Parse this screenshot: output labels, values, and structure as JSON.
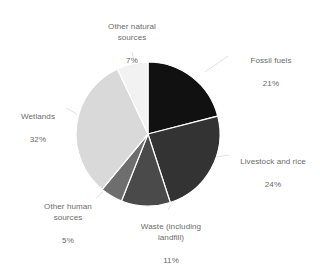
{
  "chart_data": {
    "type": "pie",
    "title": "",
    "subtitle": "",
    "xlabel": "",
    "ylabel": "",
    "legend_position": "labels-outside",
    "grid": false,
    "unit": "%",
    "categories": [
      "Fossil fuels",
      "Livestock and rice",
      "Waste (including landfill)",
      "Other human sources",
      "Wetlands",
      "Other natural sources"
    ],
    "values": [
      21,
      24,
      11,
      5,
      32,
      7
    ],
    "colors": [
      "#111111",
      "#333333",
      "#4a4a4a",
      "#6e6e6e",
      "#d9d9d9",
      "#f2f2f2"
    ],
    "slices": [
      {
        "label": "Fossil fuels",
        "value": 21,
        "value_text": "21%",
        "color": "#111111"
      },
      {
        "label": "Livestock and rice",
        "value": 24,
        "value_text": "24%",
        "color": "#333333"
      },
      {
        "label": "Waste (including\nlandfill)",
        "value": 11,
        "value_text": "11%",
        "color": "#4a4a4a"
      },
      {
        "label": "Other human\nsources",
        "value": 5,
        "value_text": "5%",
        "color": "#6e6e6e"
      },
      {
        "label": "Wetlands",
        "value": 32,
        "value_text": "32%",
        "color": "#d9d9d9"
      },
      {
        "label": "Other natural\nsources",
        "value": 7,
        "value_text": "7%",
        "color": "#f2f2f2"
      }
    ]
  },
  "labels": {
    "fossil_fuels": {
      "name": "Fossil fuels",
      "value": "21%"
    },
    "livestock_and_rice": {
      "name": "Livestock and rice",
      "value": "24%"
    },
    "waste": {
      "name": "Waste (including\nlandfill)",
      "value": "11%"
    },
    "other_human_sources": {
      "name": "Other human\nsources",
      "value": "5%"
    },
    "wetlands": {
      "name": "Wetlands",
      "value": "32%"
    },
    "other_natural_sources": {
      "name": "Other natural\nsources",
      "value": "7%"
    }
  },
  "style": {
    "text_color": "#6b6b6b",
    "background": "#ffffff",
    "leader_line_color": "#e2e2e2",
    "slice_separator_color": "#ffffff"
  }
}
